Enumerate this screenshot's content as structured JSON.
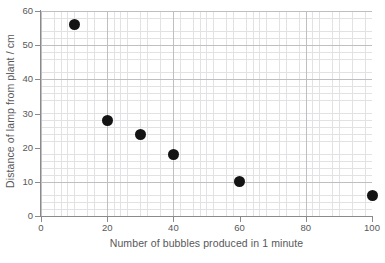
{
  "chart_data": {
    "type": "scatter",
    "title": "",
    "xlabel": "Number of bubbles produced in 1 minute",
    "ylabel": "Distance of lamp from plant / cm",
    "xlim": [
      0,
      100
    ],
    "ylim": [
      0,
      60
    ],
    "xticks": [
      0,
      20,
      40,
      60,
      80,
      100
    ],
    "yticks": [
      0,
      10,
      20,
      30,
      40,
      50,
      60
    ],
    "xtick_labels": [
      "0",
      "20",
      "40",
      "60",
      "80",
      "100"
    ],
    "ytick_labels": [
      "0",
      "10",
      "20",
      "30",
      "40",
      "50",
      "60"
    ],
    "x_minor_step": 2,
    "y_minor_step": 2,
    "grid": true,
    "grid_style": "fine graph paper, minor every 2 units, major every major tick",
    "legend": false,
    "marker": "filled-circle",
    "marker_color": "#141414",
    "grid_minor_color": "#e2e2e4",
    "grid_major_color": "#bfbfc2",
    "axis_color": "#8a8a8d",
    "text_color": "#58585a",
    "background_color": "#ffffff",
    "points": [
      {
        "x": 10,
        "y": 56
      },
      {
        "x": 20,
        "y": 28
      },
      {
        "x": 30,
        "y": 24
      },
      {
        "x": 40,
        "y": 18
      },
      {
        "x": 60,
        "y": 10
      },
      {
        "x": 100,
        "y": 6
      }
    ]
  }
}
